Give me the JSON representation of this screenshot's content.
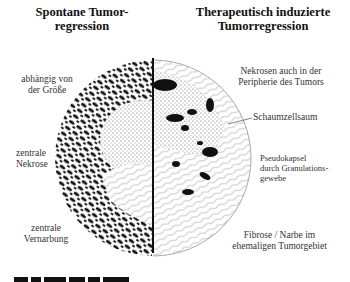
{
  "headers": {
    "left": "Spontane Tumor-\nregression",
    "right": "Therapeutisch induzierte\nTumorregression"
  },
  "left_labels": [
    {
      "id": "size",
      "text": "abhängig von\nder Größe"
    },
    {
      "id": "necrosis",
      "text": "zentrale\nNekrose"
    },
    {
      "id": "scarring",
      "text": "zentrale\nVernarbung"
    }
  ],
  "right_labels": [
    {
      "id": "periphery",
      "text": "Nekrosen auch in der\nPeripherie des Tumors"
    },
    {
      "id": "foam",
      "text": "Schaumzellsaum"
    },
    {
      "id": "capsule",
      "text": "Pseudokapsel\ndurch Granulations-\ngewebe"
    },
    {
      "id": "fibrosis",
      "text": "Fibrose / Narbe im\nehemaligen Tumorgebiet"
    }
  ],
  "colors": {
    "cell": "#111111",
    "fibrosis": "#9a9a9a",
    "background": "#ffffff"
  }
}
